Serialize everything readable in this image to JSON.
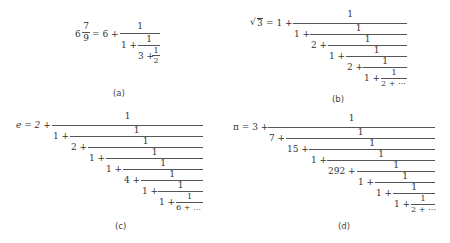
{
  "figures": [
    {
      "id": "a",
      "caption": "(a)",
      "lhs_whole": "6",
      "lhs_num": "7",
      "lhs_den": "9",
      "equals": "= 6 +",
      "terms": [
        "1 +",
        "3 +"
      ],
      "numerator": "1",
      "last_den": "2"
    },
    {
      "id": "b",
      "caption": "(b)",
      "lhs": "√3",
      "sqrt_arg": "3",
      "equals": "= 1 +",
      "terms": [
        "1 +",
        "2 +",
        "1 +",
        "2 +",
        "1 +"
      ],
      "numerator": "1",
      "tail": "2 + ⋯"
    },
    {
      "id": "c",
      "caption": "(c)",
      "lhs": "e = 2 +",
      "terms": [
        "1 +",
        "2 +",
        "1 +",
        "1 +",
        "4 +",
        "1 +",
        "1 +"
      ],
      "numerator": "1",
      "tail": "6 + …"
    },
    {
      "id": "d",
      "caption": "(d)",
      "lhs": "π = 3 +",
      "terms": [
        "7 +",
        "15 +",
        "1 +",
        "292 +",
        "1 +",
        "1 +",
        "1 +"
      ],
      "numerator": "1",
      "tail": "2 + ⋯"
    }
  ]
}
